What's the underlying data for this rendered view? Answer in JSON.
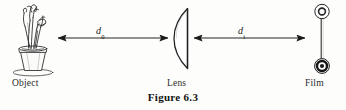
{
  "figure": {
    "caption": "Figure 6.3",
    "background_color": "#fdfdfc",
    "ink_color": "#1a1a1a",
    "width": 346,
    "height": 110
  },
  "labels": {
    "object": "Object",
    "lens": "Lens",
    "film": "Film"
  },
  "distances": {
    "object_distance": {
      "symbol": "d",
      "subscript": "0",
      "full": "d0"
    },
    "image_distance": {
      "symbol": "d",
      "subscript": "i",
      "full": "di"
    }
  },
  "elements": {
    "object_icon": "potted-plant-icon",
    "lens_icon": "plano-convex-lens-icon",
    "film_icon": "film-spool-icon",
    "arrow_left_icon": "arrow-left-icon",
    "arrow_right_icon": "arrow-right-icon"
  }
}
